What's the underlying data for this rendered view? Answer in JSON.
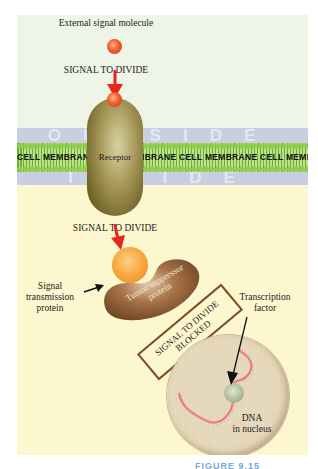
{
  "diagram": {
    "regions": {
      "outside_word": "OUTSIDE",
      "inside_word": "INSIDE",
      "membrane_text": "CELL MEMBRANE CELL MEMBRANE CELL MEMBRANE CELL MEMBRANE"
    },
    "labels": {
      "external_signal_molecule": "External signal molecule",
      "signal_to_divide_top": "SIGNAL TO DIVIDE",
      "receptor": "Receptor",
      "signal_to_divide_bottom": "SIGNAL TO DIVIDE",
      "signal_transmission_line1": "Signal",
      "signal_transmission_line2": "transmission",
      "signal_transmission_line3": "protein",
      "tumor_suppressor_line1": "Tumor suppressor",
      "tumor_suppressor_line2": "protein",
      "blocked_line1": "SIGNAL TO DIVIDE",
      "blocked_line2": "BLOCKED",
      "transcription_line1": "Transcription",
      "transcription_line2": "factor",
      "dna_line1": "DNA",
      "dna_line2": "in nucleus"
    },
    "caption": "FIGURE 9.15"
  },
  "colors": {
    "outside_background": "#eef5e6",
    "inside_background": "#fdf7cf",
    "membrane_band": "#c9cfe0",
    "lipid_green": "#8fce4c",
    "receptor_olive": "#8c7d3c",
    "signal_molecule_red": "#f25c2a",
    "arrow_red": "#e8261a",
    "signal_protein_orange": "#f5a43a",
    "tumor_suppressor_brown": "#8a5a30",
    "blocked_box_border": "#7a4f23",
    "nucleus_tan": "#e5d8ba",
    "dna_pink": "#e67a86",
    "transcription_factor_green": "#a9b996"
  }
}
